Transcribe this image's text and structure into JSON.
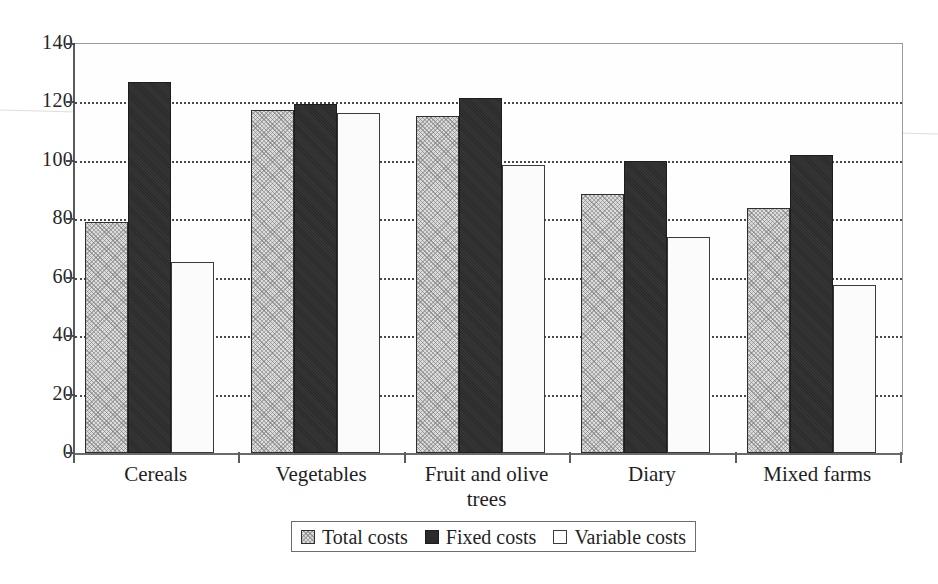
{
  "chart_data": {
    "type": "bar",
    "title": "",
    "xlabel": "",
    "ylabel": "",
    "ylim": [
      0,
      140
    ],
    "grid": true,
    "legend_position": "bottom",
    "categories": [
      "Cereals",
      "Vegetables",
      "Fruit and olive trees",
      "Diary",
      "Mixed farms"
    ],
    "ytick_labels": [
      "0",
      "20",
      "40",
      "60",
      "80",
      "100",
      "120",
      "140"
    ],
    "ytick_values": [
      0,
      20,
      40,
      60,
      80,
      100,
      120,
      140
    ],
    "series": [
      {
        "name": "Total costs",
        "style": "light-hatched",
        "color": "#dcdcdc",
        "values": [
          79,
          117.5,
          115.5,
          88.5,
          84
        ]
      },
      {
        "name": "Fixed costs",
        "style": "solid-dark",
        "color": "#2b2b2b",
        "values": [
          127,
          119.5,
          121.5,
          100,
          102
        ]
      },
      {
        "name": "Variable costs",
        "style": "white-outline",
        "color": "#ffffff",
        "values": [
          65.5,
          116.5,
          98.5,
          74,
          57.5
        ]
      }
    ]
  },
  "legend": {
    "items": [
      {
        "label": "Total costs"
      },
      {
        "label": "Fixed costs"
      },
      {
        "label": "Variable costs"
      }
    ]
  }
}
